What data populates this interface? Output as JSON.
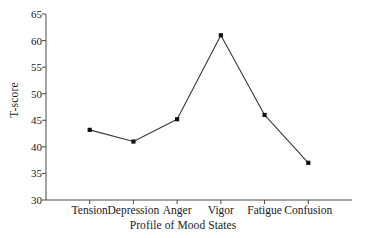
{
  "chart_data": {
    "type": "line",
    "title": "",
    "subtitle": "",
    "xlabel": "Profile of Mood States",
    "ylabel": "T-score",
    "categories": [
      "Tension",
      "Depression",
      "Anger",
      "Vigor",
      "Fatigue",
      "Confusion"
    ],
    "values": [
      43.2,
      41.0,
      45.2,
      61.0,
      46.0,
      37.0
    ],
    "series": [
      {
        "name": "T-score",
        "values": [
          43.2,
          41.0,
          45.2,
          61.0,
          46.0,
          37.0
        ]
      }
    ],
    "ylim": [
      30,
      65
    ],
    "yticks": [
      30,
      35,
      40,
      45,
      50,
      55,
      60,
      65
    ],
    "ytick_labels": [
      "30",
      "35",
      "40",
      "45",
      "50",
      "55",
      "60",
      "65"
    ],
    "xlim": [
      0,
      7
    ],
    "grid": false,
    "legend": false,
    "legend_position": "none",
    "marker": "square",
    "line_color": "#3a3a3a",
    "marker_color": "#111111",
    "axis_color": "#4a4a4a",
    "background_color": "#ffffff",
    "annotations": []
  }
}
